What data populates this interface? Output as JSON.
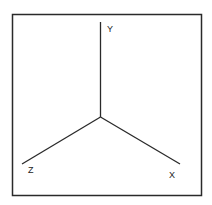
{
  "diagram": {
    "axes": [
      {
        "name": "Y",
        "label": "Y"
      },
      {
        "name": "Z",
        "label": "Z"
      },
      {
        "name": "X",
        "label": "X"
      }
    ],
    "colors": {
      "line": "#2a2a2a",
      "background": "#ffffff"
    }
  }
}
